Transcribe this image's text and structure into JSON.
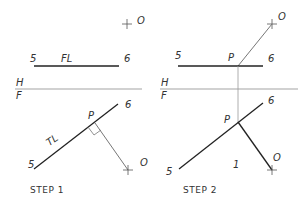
{
  "step1": {
    "caption": "STEP  1",
    "labels": {
      "o_top": "O",
      "fl_5": "5",
      "fl": "FL",
      "fl_6": "6",
      "h": "H",
      "f": "F",
      "p": "P",
      "tl": "TL",
      "tl_5": "5",
      "tl_6": "6",
      "o_bottom": "O"
    }
  },
  "step2": {
    "caption": "STEP  2",
    "labels": {
      "o_top": "O",
      "top_5": "5",
      "p_top": "P",
      "top_6": "6",
      "h": "H",
      "f": "F",
      "p": "P",
      "tl_5": "5",
      "tl_6": "6",
      "one": "1",
      "o_bottom": "O"
    }
  },
  "colors": {
    "line_dark": "#222222",
    "line_light": "#888888"
  }
}
